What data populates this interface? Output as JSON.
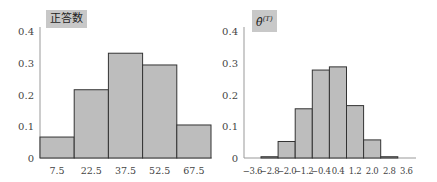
{
  "chart_data": [
    {
      "type": "bar",
      "title": "正答数",
      "xlabel": "",
      "ylabel": "",
      "categories": [
        "7.5",
        "22.5",
        "37.5",
        "52.5",
        "67.5"
      ],
      "values": [
        0.066,
        0.215,
        0.33,
        0.293,
        0.104
      ],
      "ylim": [
        0,
        0.4
      ],
      "yticks": [
        "0",
        "0.1",
        "0.2",
        "0.3",
        "0.4"
      ],
      "grid": false,
      "histogram": true
    },
    {
      "type": "bar",
      "title": "θ̂(T)",
      "title_base": "θ̂",
      "title_sup": "(T)",
      "xlabel": "",
      "ylabel": "",
      "categories": [
        "-2.8",
        "-2.0",
        "-1.2",
        "-0.4",
        "0.4",
        "1.2",
        "2.0",
        "2.8"
      ],
      "values": [
        0.004,
        0.052,
        0.155,
        0.277,
        0.287,
        0.165,
        0.057,
        0.004
      ],
      "xticks": [
        "-3.6",
        "-2.8",
        "-2.0",
        "-1.2",
        "-0.4",
        "0.4",
        "1.2",
        "2.0",
        "2.8",
        "3.6"
      ],
      "ylim": [
        0,
        0.4
      ],
      "yticks": [
        "0",
        "0.1",
        "0.2",
        "0.3",
        "0.4"
      ],
      "grid": false,
      "histogram": true
    }
  ],
  "colors": {
    "bar_fill": "#bdbdbd",
    "bar_stroke": "#333333",
    "axis": "#999999",
    "title_bg": "#c8c8c8"
  }
}
